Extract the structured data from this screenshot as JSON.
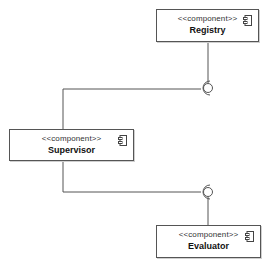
{
  "diagram": {
    "type": "uml-component",
    "components": [
      {
        "id": "registry",
        "stereotype": "<<component>>",
        "name": "Registry"
      },
      {
        "id": "supervisor",
        "stereotype": "<<component>>",
        "name": "Supervisor"
      },
      {
        "id": "evaluator",
        "stereotype": "<<component>>",
        "name": "Evaluator"
      }
    ],
    "connections": [
      {
        "from": "supervisor",
        "to": "registry",
        "kind": "required-provided-interface (ball-and-socket)"
      },
      {
        "from": "supervisor",
        "to": "evaluator",
        "kind": "required-provided-interface (ball-and-socket)"
      }
    ],
    "colors": {
      "line": "#555555",
      "box_border": "#555555",
      "background": "#ffffff"
    }
  }
}
